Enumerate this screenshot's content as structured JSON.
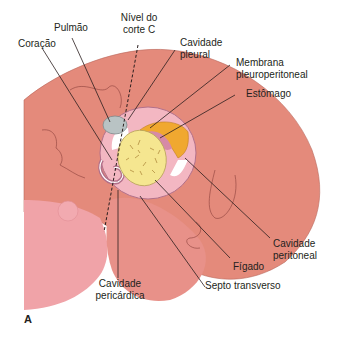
{
  "figure": {
    "panel_letter": "A",
    "colors": {
      "body_skin": "#e48a7b",
      "body_skin_light": "#ee9e92",
      "lower_body_pink": "#ea8f8f",
      "left_body_pink": "#f0a3a8",
      "cavity_pink": "#f3b7c2",
      "lung_gray": "#b9c3c4",
      "liver_yellow": "#f5e690",
      "stomach_orange": "#f0a830",
      "membrane_purple": "#d68aa6",
      "leader_line": "#2b1e1e",
      "outline": "#9a4f48"
    },
    "labels": {
      "coracao": "Coração",
      "pulmao": "Pulmão",
      "nivel_line1": "Nível do",
      "nivel_line2": "corte C",
      "cav_pleural_line1": "Cavidade",
      "cav_pleural_line2": "pleural",
      "membrana_line1": "Membrana",
      "membrana_line2": "pleuroperitoneal",
      "estomago": "Estômago",
      "cav_peritoneal_line1": "Cavidade",
      "cav_peritoneal_line2": "peritoneal",
      "figado": "Fígado",
      "septo": "Septo transverso",
      "cav_pericardica_line1": "Cavidade",
      "cav_pericardica_line2": "pericárdica"
    }
  }
}
